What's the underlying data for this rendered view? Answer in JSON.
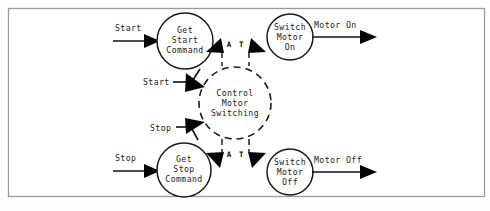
{
  "diagram": {
    "type": "data-flow-diagram",
    "frame": {
      "visible": true,
      "color": "#9a9a9a"
    },
    "processes": [
      {
        "id": "get-start-command",
        "label_lines": [
          "Get",
          "Start",
          "Command"
        ],
        "line1": "Get",
        "line2": "Start",
        "line3": "Command",
        "shape": "circle",
        "style": "solid",
        "cx": 185,
        "cy": 41,
        "r": 28
      },
      {
        "id": "get-stop-command",
        "label_lines": [
          "Get",
          "Stop",
          "Command"
        ],
        "line1": "Get",
        "line2": "Stop",
        "line3": "Command",
        "shape": "circle",
        "style": "solid",
        "cx": 184,
        "cy": 170,
        "r": 27
      },
      {
        "id": "switch-motor-on",
        "label_lines": [
          "Switch",
          "Motor",
          "On"
        ],
        "line1": "Switch",
        "line2": "Motor",
        "line3": "On",
        "shape": "circle",
        "style": "solid",
        "cx": 290,
        "cy": 37,
        "r": 23
      },
      {
        "id": "switch-motor-off",
        "label_lines": [
          "Switch",
          "Motor",
          "Off"
        ],
        "line1": "Switch",
        "line2": "Motor",
        "line3": "Off",
        "shape": "circle",
        "style": "solid",
        "cx": 290,
        "cy": 172,
        "r": 23
      },
      {
        "id": "control-motor-switching",
        "label_lines": [
          "Control",
          "Motor",
          "Switching"
        ],
        "line1": "Control",
        "line2": "Motor",
        "line3": "Switching",
        "shape": "circle",
        "style": "dashed",
        "cx": 235,
        "cy": 103,
        "r": 36
      }
    ],
    "flows": [
      {
        "id": "flow-start-in",
        "label": "Start",
        "from": "external",
        "to": "get-start-command"
      },
      {
        "id": "flow-stop-in",
        "label": "Stop",
        "from": "external",
        "to": "get-stop-command"
      },
      {
        "id": "flow-motor-on",
        "label": "Motor On",
        "from": "switch-motor-on",
        "to": "external"
      },
      {
        "id": "flow-motor-off",
        "label": "Motor Off",
        "from": "switch-motor-off",
        "to": "external"
      },
      {
        "id": "flow-start-ctl",
        "label": "Start",
        "from": "get-start-command",
        "to": "control-motor-switching"
      },
      {
        "id": "flow-stop-ctl",
        "label": "Stop",
        "from": "get-stop-command",
        "to": "control-motor-switching"
      }
    ],
    "control_labels": [
      {
        "id": "control-label-top",
        "text": "A T"
      },
      {
        "id": "control-label-bottom",
        "text": "A T"
      }
    ]
  }
}
